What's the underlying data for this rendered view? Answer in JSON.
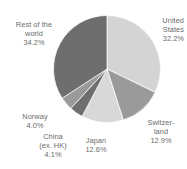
{
  "chart_data": {
    "type": "pie",
    "title": "",
    "subtitle": "",
    "xlabel": "",
    "ylabel": "",
    "legend_position": "none",
    "grid": false,
    "units": "percent",
    "start_angle_deg": 0,
    "direction": "clockwise",
    "categories": [
      "United States",
      "Switzerland",
      "Japan",
      "China (ex. HK)",
      "Norway",
      "Rest of the world"
    ],
    "values": [
      32.2,
      12.9,
      12.6,
      4.1,
      4.0,
      34.2
    ],
    "slices": [
      {
        "name": "United States",
        "value": 32.2,
        "value_label": "32.2%",
        "label_lines": [
          "United",
          "States",
          "32.2%"
        ],
        "color": "#d4d4d4"
      },
      {
        "name": "Switzerland",
        "value": 12.9,
        "value_label": "12.9%",
        "label_lines": [
          "Switzer-",
          "land",
          "12.9%"
        ],
        "color": "#9a9a9a"
      },
      {
        "name": "Japan",
        "value": 12.6,
        "value_label": "12.6%",
        "label_lines": [
          "Japan",
          "12.6%"
        ],
        "color": "#d8d8d8"
      },
      {
        "name": "China (ex. HK)",
        "value": 4.1,
        "value_label": "4.1%",
        "label_lines": [
          "China",
          "(ex. HK)",
          "4.1%"
        ],
        "color": "#6e6e6e"
      },
      {
        "name": "Norway",
        "value": 4.0,
        "value_label": "4.0%",
        "label_lines": [
          "Norway",
          "4.0%"
        ],
        "color": "#9a9a9a"
      },
      {
        "name": "Rest of the world",
        "value": 34.2,
        "value_label": "34.2%",
        "label_lines": [
          "Rest of the",
          "world",
          "34.2%"
        ],
        "color": "#6e6e6e"
      }
    ]
  },
  "labels": {
    "united_states": "United\nStates\n32.2%",
    "switzerland": "Switzer-\nland\n12.9%",
    "japan": "Japan\n12.6%",
    "china": "China\n(ex. HK)\n4.1%",
    "norway": "Norway\n4.0%",
    "rest_of_world": "Rest of the\nworld\n34.2%"
  },
  "colors": {
    "background": "#ffffff",
    "label_text": "#6b6b6b",
    "light_slice": "#d4d4d4",
    "light_slice_alt": "#d8d8d8",
    "medium_slice": "#9a9a9a",
    "dark_slice": "#6e6e6e",
    "slice_outline": "#ffffff"
  }
}
